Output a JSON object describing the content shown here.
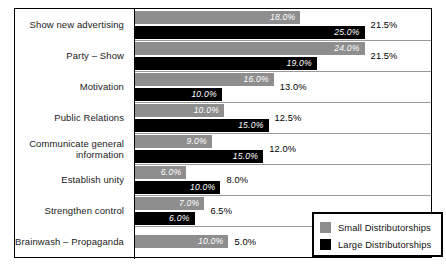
{
  "chart_data": {
    "type": "bar",
    "orientation": "horizontal",
    "title": "",
    "xlabel": "",
    "ylabel": "",
    "grid": false,
    "legend_position": "bottom-right",
    "xlim": [
      0,
      27
    ],
    "categories": [
      "Show new advertising",
      "Party – Show",
      "Motivation",
      "Public Relations",
      "Communicate general information",
      "Establish unity",
      "Strengthen control",
      "Brainwash – Propaganda"
    ],
    "series": [
      {
        "name": "Small Distributorships",
        "color": "#8e8e8e",
        "values": [
          18.0,
          24.0,
          16.0,
          10.0,
          9.0,
          6.0,
          7.0,
          10.0
        ],
        "labels": [
          "18.0%",
          "24.0%",
          "16.0%",
          "10.0%",
          "9.0%",
          "6.0%",
          "7.0%",
          "10.0%"
        ]
      },
      {
        "name": "Large Distributorships",
        "color": "#000000",
        "values": [
          25.0,
          19.0,
          10.0,
          15.0,
          15.0,
          10.0,
          6.0,
          null
        ],
        "labels": [
          "25.0%",
          "19.0%",
          "10.0%",
          "15.0%",
          "15.0%",
          "10.0%",
          "6.0%",
          null
        ]
      }
    ],
    "totals": {
      "labels": [
        "21.5%",
        "21.5%",
        "13.0%",
        "12.5%",
        "12.0%",
        "8.0%",
        "6.5%",
        "5.0%"
      ],
      "values": [
        21.5,
        21.5,
        13.0,
        12.5,
        12.0,
        8.0,
        6.5,
        5.0
      ]
    }
  },
  "legend": {
    "items": [
      {
        "label": "Small Distributorships",
        "color": "#8e8e8e"
      },
      {
        "label": "Large Distributorships",
        "color": "#000000"
      }
    ]
  }
}
